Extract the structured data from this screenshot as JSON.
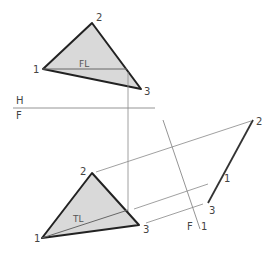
{
  "figure": {
    "type": "descriptive-geometry auxiliary view",
    "top_view": {
      "vertex_labels": [
        "1",
        "2",
        "3"
      ],
      "line_label": "FL"
    },
    "front_view": {
      "vertex_labels": [
        "1",
        "2",
        "3"
      ],
      "line_label": "TL"
    },
    "fold_line_hf": {
      "upper_label": "H",
      "lower_label": "F"
    },
    "fold_line_f1": {
      "label_left": "F",
      "label_right": "1"
    },
    "edge_view": {
      "point_labels": [
        "2",
        "1",
        "3"
      ]
    },
    "colors": {
      "fill": "#d9d9d9",
      "outline": "#222222",
      "construction": "#888888"
    }
  }
}
